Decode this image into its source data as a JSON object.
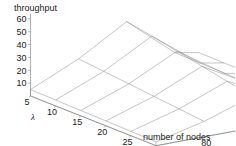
{
  "chart_data": {
    "type": "line",
    "render": "surface3d-wireframe",
    "title": "",
    "zlabel": "throughput",
    "xlabel": "number of nodes",
    "ylabel": "λ",
    "x": [
      40,
      80,
      120,
      160
    ],
    "x_ticks": [
      "40",
      "80",
      "120",
      "160"
    ],
    "y": [
      5,
      10,
      15,
      20,
      25,
      30
    ],
    "y_ticks": [
      "5",
      "10",
      "15",
      "20",
      "25",
      "30"
    ],
    "z_ticks": [
      "10",
      "20",
      "30",
      "40",
      "50",
      "60"
    ],
    "zlim": [
      0,
      65
    ],
    "xlim": [
      40,
      180
    ],
    "ylim": [
      5,
      30
    ],
    "grid": false,
    "legend": null,
    "series": [
      {
        "name": "λ=5",
        "values": [
          5.0,
          22.0,
          44.0,
          13.0
        ]
      },
      {
        "name": "λ=10",
        "values": [
          4.6,
          20.0,
          40.5,
          12.6
        ]
      },
      {
        "name": "λ=15",
        "values": [
          4.2,
          18.0,
          36.5,
          12.2
        ]
      },
      {
        "name": "λ=20",
        "values": [
          3.8,
          16.0,
          32.5,
          11.8
        ]
      },
      {
        "name": "λ=25",
        "values": [
          3.4,
          14.0,
          28.5,
          11.4
        ]
      },
      {
        "name": "λ=30",
        "values": [
          3.0,
          12.0,
          24.5,
          11.0
        ]
      }
    ],
    "colors": {
      "mesh": "#8a8a8a",
      "axis": "#6f6f6f",
      "text": "#1a1a1a",
      "background": "#ffffff"
    }
  }
}
